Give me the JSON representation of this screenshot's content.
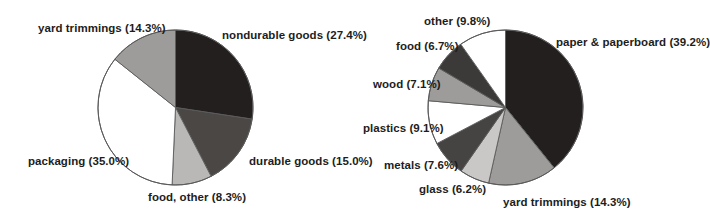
{
  "figure": {
    "background_color": "#ffffff",
    "charts": [
      {
        "id": "msw-generation-by-category",
        "center": {
          "x": 175.5,
          "y": 107.5
        },
        "radius": 77.5,
        "outline_color": "#5a5a5a"
      },
      {
        "id": "msw-generation-by-material",
        "center": {
          "x": 505.5,
          "y": 107.5
        },
        "radius": 77.5,
        "outline_color": "#5a5a5a"
      }
    ]
  },
  "chart_data": [
    {
      "type": "pie",
      "title": "",
      "subtitle": "",
      "xlabel": "",
      "ylabel": "",
      "legend_position": "none",
      "grid": false,
      "start_angle_deg": 0,
      "direction": "clockwise",
      "units": "percent",
      "total": 100.0,
      "categories": [
        "nondurable goods",
        "durable goods",
        "food, other",
        "packaging",
        "yard trimmings"
      ],
      "values": [
        27.4,
        15.0,
        8.3,
        35.0,
        14.3
      ],
      "slice_colors": [
        "#231f1e",
        "#4a4745",
        "#b9b8b6",
        "#ffffff",
        "#9d9c9a"
      ],
      "labels": [
        "nondurable goods (27.4%)",
        "durable goods (15.0%)",
        "food, other (8.3%)",
        "packaging (35.0%)",
        "yard trimmings (14.3%)"
      ]
    },
    {
      "type": "pie",
      "title": "",
      "subtitle": "",
      "xlabel": "",
      "ylabel": "",
      "legend_position": "none",
      "grid": false,
      "start_angle_deg": 0,
      "direction": "clockwise",
      "units": "percent",
      "total": 100.0,
      "categories": [
        "paper & paperboard",
        "yard trimmings",
        "glass",
        "metals",
        "plastics",
        "wood",
        "food",
        "other"
      ],
      "values": [
        39.2,
        14.3,
        6.2,
        7.6,
        9.1,
        7.1,
        6.7,
        9.8
      ],
      "slice_colors": [
        "#231f1e",
        "#9d9c9a",
        "#c9c8c6",
        "#464442",
        "#ffffff",
        "#9d9c9a",
        "#3c3a38",
        "#ffffff"
      ],
      "labels": [
        "paper & paperboard (39.2%)",
        "yard trimmings (14.3%)",
        "glass (6.2%)",
        "metals (7.6%)",
        "plastics (9.1%)",
        "wood (7.1%)",
        "food (6.7%)",
        "other (9.8%)"
      ]
    }
  ],
  "left_chart_labels": {
    "yard_trimmings": "yard trimmings (14.3%)",
    "nondurable_goods": "nondurable goods (27.4%)",
    "durable_goods": "durable goods (15.0%)",
    "food_other": "food, other (8.3%)",
    "packaging": "packaging (35.0%)"
  },
  "right_chart_labels": {
    "other": "other (9.8%)",
    "food": "food (6.7%)",
    "wood": "wood (7.1%)",
    "plastics": "plastics (9.1%)",
    "metals": "metals (7.6%)",
    "glass": "glass (6.2%)",
    "yard_trimmings": "yard trimmings (14.3%)",
    "paper_paperboard": "paper & paperboard (39.2%)"
  }
}
